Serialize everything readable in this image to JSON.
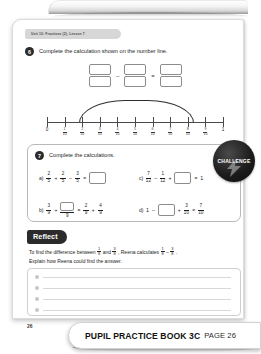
{
  "running_head": "Unit 10: Fractions (2), Lesson 7",
  "question6": {
    "number": "6",
    "text": "Complete the calculation shown on the number line.",
    "operators": [
      "–",
      "="
    ],
    "boxes": 3,
    "number_line": {
      "start_label": "0",
      "end_label": "1",
      "denominator": "10",
      "numerators": [
        "1",
        "2",
        "3",
        "4",
        "5",
        "6",
        "7",
        "8",
        "9"
      ],
      "jump_from": "2",
      "jump_to": "9"
    }
  },
  "question7": {
    "number": "7",
    "text": "Complete the calculations.",
    "challenge_badge": "CHALLENGE",
    "items": [
      {
        "label": "a)",
        "parts": [
          {
            "type": "frac",
            "num": "2",
            "den": "5"
          },
          {
            "type": "sym",
            "text": "+"
          },
          {
            "type": "frac",
            "num": "2",
            "den": "5"
          },
          {
            "type": "sym",
            "text": "–"
          },
          {
            "type": "frac",
            "num": "3",
            "den": "5"
          },
          {
            "type": "sym",
            "text": "="
          },
          {
            "type": "box"
          }
        ]
      },
      {
        "label": "c)",
        "parts": [
          {
            "type": "frac",
            "num": "7",
            "den": "12"
          },
          {
            "type": "sym",
            "text": "–"
          },
          {
            "type": "frac",
            "num": "1",
            "den": "12"
          },
          {
            "type": "sym",
            "text": "+"
          },
          {
            "type": "box"
          },
          {
            "type": "sym",
            "text": "="
          },
          {
            "type": "whole",
            "text": "1"
          }
        ]
      },
      {
        "label": "b)",
        "parts": [
          {
            "type": "frac",
            "num": "3",
            "den": "9"
          },
          {
            "type": "sym",
            "text": "+"
          },
          {
            "type": "boxfrac",
            "den": "9"
          },
          {
            "type": "sym",
            "text": "="
          },
          {
            "type": "frac",
            "num": "2",
            "den": "9"
          },
          {
            "type": "sym",
            "text": "+"
          },
          {
            "type": "frac",
            "num": "4",
            "den": "9"
          }
        ]
      },
      {
        "label": "d)",
        "parts": [
          {
            "type": "whole",
            "text": "1"
          },
          {
            "type": "sym",
            "text": "–"
          },
          {
            "type": "box"
          },
          {
            "type": "sym",
            "text": "+"
          },
          {
            "type": "frac",
            "num": "3",
            "den": "10"
          },
          {
            "type": "sym",
            "text": "="
          },
          {
            "type": "frac",
            "num": "7",
            "den": "10"
          }
        ]
      }
    ]
  },
  "reflect": {
    "tab_label": "Reflect",
    "line1_a": "To find the difference between",
    "frac1": {
      "num": "1",
      "den": "8"
    },
    "line1_b": "and",
    "frac2": {
      "num": "3",
      "den": "8"
    },
    "line1_c": ", Reena calculates",
    "frac3": {
      "num": "1",
      "den": "8"
    },
    "line1_d": "–",
    "frac4": {
      "num": "3",
      "den": "8"
    },
    "line1_e": ".",
    "line2": "Explain how Reena could find the answer.",
    "answer_lines": 4
  },
  "folio": "26",
  "footer": {
    "title": "PUPIL PRACTICE BOOK 3C",
    "page": "PAGE 26"
  },
  "colors": {
    "ink": "#1e1e1e",
    "badge": "#1d1d1d",
    "rule": "#d8d8d8",
    "accent_tab": "#2b2b2b"
  }
}
